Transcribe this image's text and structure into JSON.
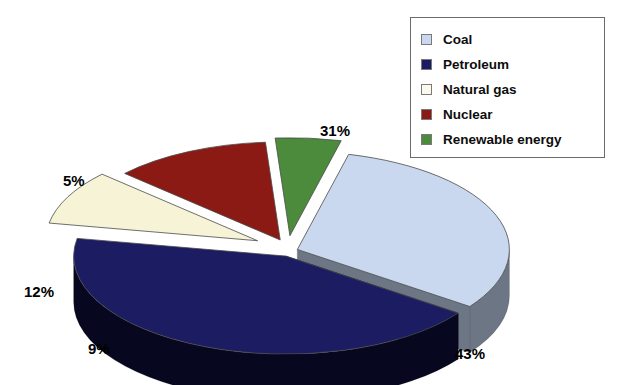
{
  "chart_data": {
    "type": "pie",
    "title": "",
    "subtitle": "",
    "xlabel": "",
    "ylabel": "",
    "legend_position": "top-right",
    "style": "3d-exploded",
    "categories": [
      "Coal",
      "Petroleum",
      "Natural gas",
      "Nuclear",
      "Renewable energy"
    ],
    "values": [
      31,
      43,
      9,
      12,
      5
    ],
    "value_unit": "%",
    "slices": [
      {
        "label": "Coal",
        "value": 31,
        "data_label": "31%",
        "top_color": "#c9d8ee",
        "side_color": "#6d7684",
        "swatch_color": "#c9d8ee"
      },
      {
        "label": "Petroleum",
        "value": 43,
        "data_label": "43%",
        "top_color": "#1c1c63",
        "side_color": "#07071f",
        "swatch_color": "#1c1c63"
      },
      {
        "label": "Natural gas",
        "value": 9,
        "data_label": "9%",
        "top_color": "#f6f3d6",
        "side_color": "#9a9a6b",
        "swatch_color": "#fbfaec"
      },
      {
        "label": "Nuclear",
        "value": 12,
        "data_label": "12%",
        "top_color": "#8b1a14",
        "side_color": "#3c0a07",
        "swatch_color": "#8b1a14"
      },
      {
        "label": "Renewable energy",
        "value": 5,
        "data_label": "5%",
        "top_color": "#4c8a3c",
        "side_color": "#2a5020",
        "swatch_color": "#4c8a3c"
      }
    ],
    "colors": {
      "coal": "#c9d8ee",
      "petroleum": "#1c1c63",
      "natural_gas": "#f6f3d6",
      "nuclear": "#8b1a14",
      "renewable_energy": "#4c8a3c",
      "background": "#ffffff",
      "legend_border": "#6b6b6b",
      "label_text": "#000000"
    }
  },
  "legend": {
    "items": [
      {
        "label": "Coal"
      },
      {
        "label": "Petroleum"
      },
      {
        "label": "Natural gas"
      },
      {
        "label": "Nuclear"
      },
      {
        "label": "Renewable energy"
      }
    ]
  },
  "labels": {
    "coal": "31%",
    "petroleum": "43%",
    "natural_gas": "9%",
    "nuclear": "12%",
    "renewable": "5%"
  }
}
